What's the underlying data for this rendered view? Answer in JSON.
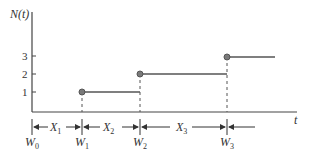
{
  "diagram": {
    "y_axis_label": "N(t)",
    "x_axis_label": "t",
    "y_ticks": [
      "1",
      "2",
      "3"
    ],
    "arrival_labels": [
      "W",
      "W",
      "W",
      "W"
    ],
    "arrival_subscripts": [
      "0",
      "1",
      "2",
      "3"
    ],
    "interval_labels": [
      "X",
      "X",
      "X"
    ],
    "interval_subscripts": [
      "1",
      "2",
      "3"
    ],
    "colors": {
      "line": "#555555",
      "dot": "#7a7a7a",
      "text": "#333333"
    }
  }
}
